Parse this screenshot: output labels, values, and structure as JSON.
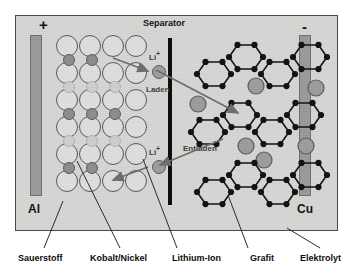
{
  "diagram": {
    "title_separator": "Separator",
    "polarity_positive": "+",
    "polarity_negative": "-",
    "current_collector_left": "Al",
    "current_collector_right": "Cu",
    "ion_label_top": "Li",
    "ion_superscript_top": "+",
    "ion_label_bottom": "Li",
    "ion_superscript_bottom": "+",
    "process_charge": "Laden",
    "process_discharge": "Entladen"
  },
  "legend": {
    "items": [
      {
        "key": "oxygen",
        "label": "Sauerstoff"
      },
      {
        "key": "cobalt_nickel",
        "label": "Kobalt/Nickel"
      },
      {
        "key": "lithium_ion",
        "label": "Lithium-Ion"
      },
      {
        "key": "graphite",
        "label": "Grafit"
      },
      {
        "key": "electrolyte",
        "label": "Elektrolyt"
      }
    ]
  },
  "colors": {
    "background": "#ffffff",
    "cell_fill": "#d6d6d4",
    "cell_border": "#4a4a4a",
    "electrode_fill": "#9a9a99",
    "separator": "#0b0b0b",
    "oxygen_circle": "#dededc",
    "oxygen_stroke": "#595959",
    "metal_circle": "#8d8d8c",
    "metal_faded": "#cfcfcd",
    "lithium_ion": "#9d9d9c",
    "carbon_atom": "#111111",
    "arrow": "#6e6e6e",
    "leader_line": "#2b2b2b",
    "text": "#0d0d0d"
  },
  "structure": {
    "cathode_lattice_rows": 6,
    "cathode_lattice_cols": 4,
    "interstitial_rows": [
      {
        "index": 0,
        "type": "metal",
        "cols": [
          0,
          1
        ]
      },
      {
        "index": 1,
        "type": "faded",
        "cols": [
          0,
          1,
          2
        ]
      },
      {
        "index": 2,
        "type": "metal",
        "cols": [
          0,
          1,
          2
        ]
      },
      {
        "index": 3,
        "type": "faded",
        "cols": [
          0,
          1,
          2
        ]
      },
      {
        "index": 4,
        "type": "metal",
        "cols": [
          0,
          1
        ]
      }
    ],
    "graphite_sheets": 3,
    "graphite_rings_per_sheet": 3,
    "intercalated_li_per_sheet": [
      2,
      3,
      1
    ]
  }
}
